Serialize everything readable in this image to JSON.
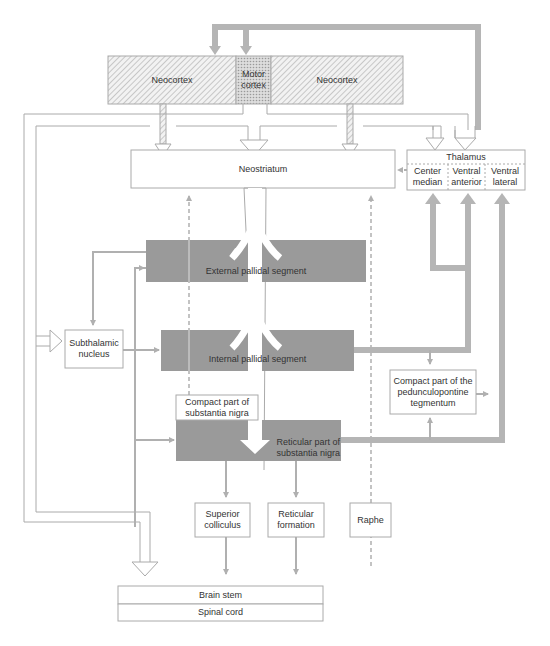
{
  "diagram": {
    "cortex": {
      "left": "Neocortex",
      "motor": "Motor cortex",
      "right": "Neocortex"
    },
    "neostriatum": "Neostriatum",
    "thalamus": {
      "title": "Thalamus",
      "nuclei": [
        "Center median",
        "Ventral anterior",
        "Ventral lateral"
      ]
    },
    "external_pallidal": "External pallidal segment",
    "internal_pallidal": "Internal pallidal segment",
    "subthalamic": "Subthalamic nucleus",
    "compact_sn": "Compact part of substantia nigra",
    "reticular_sn": "Reticular part of substantia nigra",
    "pedunculopontine": "Compact part of the pedunculopontine tegmentum",
    "superior_colliculus": "Superior colliculus",
    "reticular_formation": "Reticular formation",
    "raphe": "Raphe",
    "brain_stem": "Brain stem",
    "spinal_cord": "Spinal cord"
  },
  "colors": {
    "pathway": "#b0b0b0",
    "nucleus_fill": "#9a9a9a",
    "outline": "#aaaaaa",
    "text": "#333333"
  }
}
